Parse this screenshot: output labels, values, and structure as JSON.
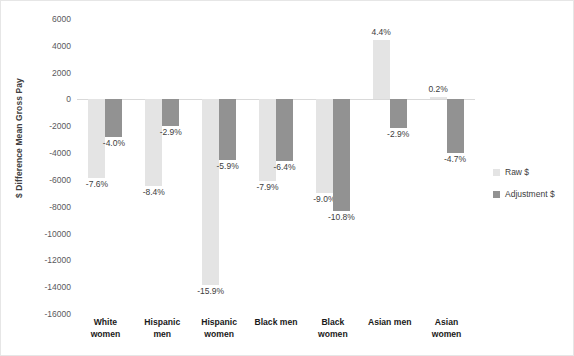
{
  "chart_data": {
    "type": "bar",
    "title": "",
    "xlabel": "",
    "ylabel": "$ Difference Mean Gross Pay",
    "ylim": [
      -16000,
      6000
    ],
    "ytick_step": 2000,
    "grid": false,
    "legend_position": "right",
    "categories": [
      "White women",
      "Hispanic men",
      "Hispanic women",
      "Black men",
      "Black women",
      "Asian men",
      "Asian women"
    ],
    "category_lines": [
      [
        "White",
        "women"
      ],
      [
        "Hispanic",
        "men"
      ],
      [
        "Hispanic",
        "women"
      ],
      [
        "Black men",
        ""
      ],
      [
        "Black",
        "women"
      ],
      [
        "Asian men",
        ""
      ],
      [
        "Asian",
        "women"
      ]
    ],
    "yticks": [
      "6000",
      "4000",
      "2000",
      "0",
      "-2000",
      "-4000",
      "-6000",
      "-8000",
      "-10000",
      "-12000",
      "-14000",
      "-16000"
    ],
    "ytick_values": [
      6000,
      4000,
      2000,
      0,
      -2000,
      -4000,
      -6000,
      -8000,
      -10000,
      -12000,
      -14000,
      -16000
    ],
    "series": [
      {
        "name": "Raw $",
        "color": "#e4e4e4",
        "values": [
          -5840,
          -6480,
          -13840,
          -6080,
          -6960,
          4400,
          200
        ],
        "data_labels": [
          "-7.6%",
          "-8.4%",
          "-15.9%",
          "-7.9%",
          "-9.0%",
          "4.4%",
          "0.2%"
        ]
      },
      {
        "name": "Adjustment $",
        "color": "#929292",
        "values": [
          -2800,
          -2000,
          -4480,
          -4560,
          -8320,
          -2160,
          -4000
        ],
        "data_labels": [
          "-4.0%",
          "-2.9%",
          "-5.9%",
          "-6.4%",
          "-10.8%",
          "-2.9%",
          "-4.7%"
        ]
      }
    ]
  },
  "legend": {
    "items": [
      {
        "label": "Raw $",
        "color": "#e4e4e4"
      },
      {
        "label": "Adjustment $",
        "color": "#929292"
      }
    ]
  }
}
